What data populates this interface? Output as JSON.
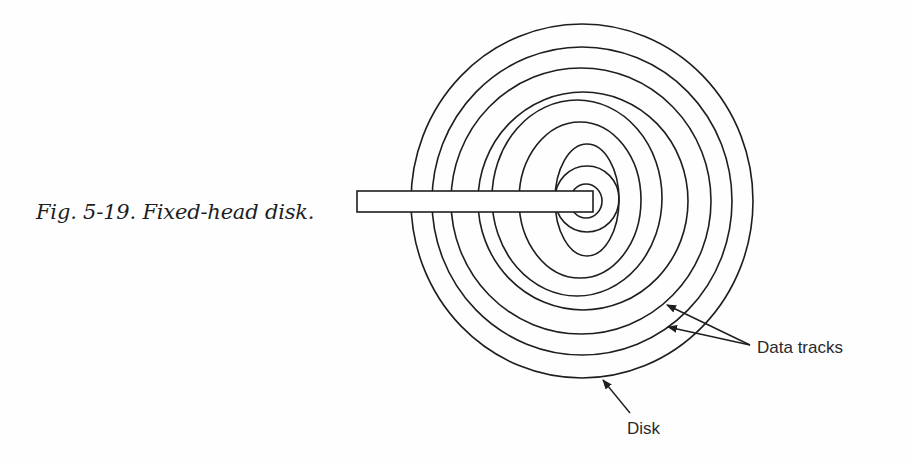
{
  "figure": {
    "caption": "Fig. 5-19. Fixed-head disk.",
    "number": "5-19",
    "title": "Fixed-head disk."
  },
  "labels": {
    "data_tracks": "Data tracks",
    "disk": "Disk"
  },
  "colors": {
    "ink": "#1e1e1e",
    "paper": "#fefefe"
  },
  "diagram": {
    "tracks": [
      {
        "cx": 582,
        "cy": 201,
        "rx": 171,
        "ry": 177,
        "role": "disk edge"
      },
      {
        "cx": 582,
        "cy": 201,
        "rx": 150,
        "ry": 154,
        "role": "data track"
      },
      {
        "cx": 581,
        "cy": 201,
        "rx": 130,
        "ry": 133,
        "role": "data track"
      },
      {
        "cx": 583,
        "cy": 201,
        "rx": 105,
        "ry": 109,
        "role": "data track"
      },
      {
        "cx": 577,
        "cy": 198,
        "rx": 85,
        "ry": 98,
        "role": "data track"
      },
      {
        "cx": 580,
        "cy": 200,
        "rx": 61,
        "ry": 78,
        "role": "data track"
      },
      {
        "cx": 587,
        "cy": 200,
        "rx": 32,
        "ry": 56,
        "role": "data track"
      },
      {
        "cx": 587,
        "cy": 199,
        "rx": 32,
        "ry": 33,
        "role": "data track"
      },
      {
        "cx": 586,
        "cy": 201,
        "rx": 16,
        "ry": 17,
        "role": "data track"
      }
    ],
    "head_arm": {
      "x": 357,
      "y": 191,
      "width": 236,
      "height": 21
    },
    "arrows": [
      {
        "name": "data-track-arrow-1",
        "x1": 750,
        "y1": 345,
        "x2": 667,
        "y2": 305
      },
      {
        "name": "data-track-arrow-2",
        "x1": 750,
        "y1": 345,
        "x2": 668,
        "y2": 327
      },
      {
        "name": "disk-arrow",
        "x1": 630,
        "y1": 413,
        "x2": 603,
        "y2": 380
      }
    ]
  }
}
